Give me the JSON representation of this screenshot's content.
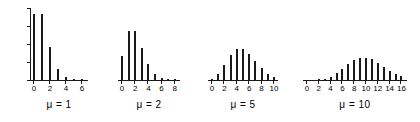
{
  "figure": {
    "background": "#ffffff",
    "ink_color": "#1a1a1a",
    "shared_y_axis": {
      "ticks": [
        "0.0",
        "0.1",
        "0.2",
        "0.3",
        "0.4"
      ],
      "values": [
        0.0,
        0.1,
        0.2,
        0.3,
        0.4
      ],
      "min": 0.0,
      "max": 0.4
    }
  },
  "chart_data": [
    {
      "type": "bar",
      "title": "",
      "annotation": "μ = 1",
      "mu": 1,
      "xlabel": "",
      "ylabel": "",
      "ylim": [
        0.0,
        0.4
      ],
      "xlim": [
        -0.6,
        6.6
      ],
      "grid": false,
      "legend": "none",
      "tick_labels": [
        "0",
        "2",
        "4",
        "6"
      ],
      "tick_values": [
        0,
        2,
        4,
        6
      ],
      "x": [
        0,
        1,
        2,
        3,
        4,
        5,
        6
      ],
      "values": [
        0.368,
        0.368,
        0.184,
        0.061,
        0.015,
        0.003,
        0.001
      ]
    },
    {
      "type": "bar",
      "title": "",
      "annotation": "μ = 2",
      "mu": 2,
      "xlabel": "",
      "ylabel": "",
      "ylim": [
        0.0,
        0.4
      ],
      "xlim": [
        -0.6,
        8.6
      ],
      "grid": false,
      "legend": "none",
      "tick_labels": [
        "0",
        "2",
        "4",
        "6",
        "8"
      ],
      "tick_values": [
        0,
        2,
        4,
        6,
        8
      ],
      "x": [
        0,
        1,
        2,
        3,
        4,
        5,
        6,
        7,
        8
      ],
      "values": [
        0.135,
        0.271,
        0.271,
        0.18,
        0.09,
        0.036,
        0.012,
        0.003,
        0.001
      ]
    },
    {
      "type": "bar",
      "title": "",
      "annotation": "μ = 5",
      "mu": 5,
      "xlabel": "",
      "ylabel": "",
      "ylim": [
        0.0,
        0.4
      ],
      "xlim": [
        -0.6,
        10.6
      ],
      "grid": false,
      "legend": "none",
      "tick_labels": [
        "0",
        "2",
        "4",
        "6",
        "8",
        "10"
      ],
      "tick_values": [
        0,
        2,
        4,
        6,
        8,
        10
      ],
      "x": [
        0,
        1,
        2,
        3,
        4,
        5,
        6,
        7,
        8,
        9,
        10
      ],
      "values": [
        0.007,
        0.034,
        0.084,
        0.14,
        0.175,
        0.175,
        0.146,
        0.104,
        0.065,
        0.036,
        0.018
      ]
    },
    {
      "type": "bar",
      "title": "",
      "annotation": "μ = 10",
      "mu": 10,
      "xlabel": "",
      "ylabel": "",
      "ylim": [
        0.0,
        0.4
      ],
      "xlim": [
        -0.6,
        16.6
      ],
      "grid": false,
      "legend": "none",
      "tick_labels": [
        "0",
        "2",
        "4",
        "6",
        "8",
        "10",
        "12",
        "14",
        "16"
      ],
      "tick_values": [
        0,
        2,
        4,
        6,
        8,
        10,
        12,
        14,
        16
      ],
      "x": [
        0,
        1,
        2,
        3,
        4,
        5,
        6,
        7,
        8,
        9,
        10,
        11,
        12,
        13,
        14,
        15,
        16
      ],
      "values": [
        0.0,
        0.0,
        0.002,
        0.008,
        0.019,
        0.038,
        0.063,
        0.09,
        0.113,
        0.125,
        0.125,
        0.114,
        0.095,
        0.073,
        0.052,
        0.035,
        0.022
      ]
    }
  ],
  "panel_layout": [
    {
      "left": 30,
      "plot_width": 58,
      "bar_pitch": 8.0,
      "bar_offset": 3
    },
    {
      "left": 118,
      "plot_width": 62,
      "bar_pitch": 6.6,
      "bar_offset": 3
    },
    {
      "left": 208,
      "plot_width": 70,
      "bar_pitch": 6.2,
      "bar_offset": 3
    },
    {
      "left": 303,
      "plot_width": 104,
      "bar_pitch": 5.9,
      "bar_offset": 3
    }
  ]
}
